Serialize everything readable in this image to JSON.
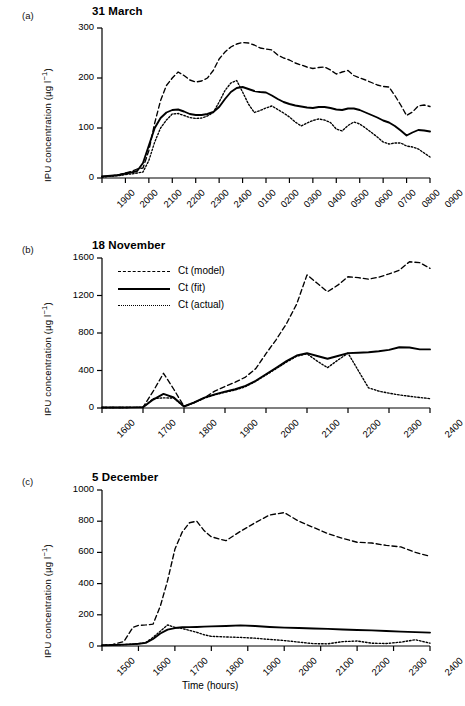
{
  "figure": {
    "series_labels": {
      "model": "Ct (model)",
      "fit": "Ct (fit)",
      "actual": "Ct (actual)"
    },
    "xaxis_title": "Time (hours)",
    "yaxis_title_parts": {
      "main": "IPU concentration (µg l",
      "exponent": "−1",
      "close": ")"
    }
  },
  "panels": [
    {
      "letter": "(a)",
      "title": "31 March",
      "ylim": [
        0,
        300
      ],
      "yticks": [
        0,
        100,
        200,
        300
      ],
      "xticks": [
        "1900",
        "2000",
        "2100",
        "2200",
        "2300",
        "2400",
        "0100",
        "0200",
        "0300",
        "0400",
        "0500",
        "0600",
        "0700",
        "0800",
        "0900"
      ]
    },
    {
      "letter": "(b)",
      "title": "18 November",
      "ylim": [
        0,
        1600
      ],
      "yticks": [
        0,
        400,
        800,
        1200,
        1600
      ],
      "xticks": [
        "1600",
        "1700",
        "1800",
        "1900",
        "2000",
        "2100",
        "2200",
        "2300",
        "2400"
      ]
    },
    {
      "letter": "(c)",
      "title": "5 December",
      "ylim": [
        0,
        1000
      ],
      "yticks": [
        0,
        200,
        400,
        600,
        800,
        1000
      ],
      "xticks": [
        "1500",
        "1600",
        "1700",
        "1800",
        "1900",
        "2000",
        "2100",
        "2200",
        "2300",
        "2400"
      ]
    }
  ],
  "chart_data": [
    {
      "type": "line",
      "panel": "(a)",
      "title": "31 March",
      "xlabel": "Time (hours)",
      "ylabel": "IPU concentration (µg l−1)",
      "ylim": [
        0,
        300
      ],
      "yticks": [
        0,
        100,
        200,
        300
      ],
      "xtick_labels": [
        "1900",
        "2000",
        "2100",
        "2200",
        "2300",
        "2400",
        "0100",
        "0200",
        "0300",
        "0400",
        "0500",
        "0600",
        "0700",
        "0800",
        "0900"
      ],
      "x_hours_from_start": [
        0,
        1,
        2,
        3,
        4,
        5,
        6,
        7,
        8,
        9,
        10,
        11,
        12,
        13,
        14
      ],
      "grid": false,
      "legend_position": "none",
      "series": [
        {
          "name": "Ct (model)",
          "style": "dashed",
          "x": [
            0,
            0.25,
            0.5,
            0.75,
            1.0,
            1.25,
            1.5,
            1.75,
            2.0,
            2.25,
            2.5,
            2.75,
            3.0,
            3.25,
            3.5,
            3.75,
            4.0,
            4.25,
            4.5,
            4.75,
            5.0,
            5.25,
            5.5,
            5.75,
            6.0,
            6.25,
            6.5,
            6.75,
            7.0,
            7.25,
            7.5,
            7.75,
            8.0,
            8.25,
            8.5,
            8.75,
            9.0,
            9.25,
            9.5,
            9.75,
            10.0,
            10.25,
            10.5,
            10.75,
            11.0,
            11.25,
            11.5,
            11.75,
            12.0,
            12.25,
            12.5,
            12.75,
            13.0,
            13.25,
            13.5,
            13.75,
            14.0
          ],
          "values": [
            3,
            4,
            5,
            7,
            10,
            13,
            18,
            20,
            55,
            110,
            155,
            185,
            200,
            212,
            205,
            196,
            192,
            194,
            200,
            215,
            238,
            252,
            262,
            268,
            271,
            270,
            266,
            260,
            258,
            256,
            246,
            240,
            236,
            230,
            226,
            222,
            219,
            221,
            222,
            216,
            208,
            212,
            215,
            205,
            200,
            196,
            191,
            186,
            183,
            182,
            165,
            146,
            125,
            132,
            144,
            146,
            143
          ]
        },
        {
          "name": "Ct (fit)",
          "style": "solid",
          "x": [
            0,
            0.25,
            0.5,
            0.75,
            1.0,
            1.25,
            1.5,
            1.75,
            2.0,
            2.25,
            2.5,
            2.75,
            3.0,
            3.25,
            3.5,
            3.75,
            4.0,
            4.25,
            4.5,
            4.75,
            5.0,
            5.25,
            5.5,
            5.75,
            6.0,
            6.25,
            6.5,
            6.75,
            7.0,
            7.25,
            7.5,
            7.75,
            8.0,
            8.25,
            8.5,
            8.75,
            9.0,
            9.25,
            9.5,
            9.75,
            10.0,
            10.25,
            10.5,
            10.75,
            11.0,
            11.25,
            11.5,
            11.75,
            12.0,
            12.25,
            12.5,
            12.75,
            13.0,
            13.25,
            13.5,
            13.75,
            14.0
          ],
          "values": [
            3,
            4,
            5,
            6,
            9,
            11,
            14,
            30,
            65,
            100,
            120,
            131,
            136,
            137,
            133,
            128,
            126,
            126,
            128,
            132,
            142,
            158,
            172,
            180,
            182,
            178,
            174,
            172,
            171,
            165,
            158,
            152,
            148,
            145,
            143,
            141,
            140,
            142,
            142,
            140,
            137,
            136,
            139,
            139,
            136,
            131,
            126,
            121,
            115,
            111,
            104,
            95,
            85,
            91,
            96,
            95,
            93
          ]
        },
        {
          "name": "Ct (actual)",
          "style": "dotted",
          "x": [
            0,
            0.25,
            0.5,
            0.75,
            1.0,
            1.25,
            1.5,
            1.75,
            2.0,
            2.25,
            2.5,
            2.75,
            3.0,
            3.25,
            3.5,
            3.75,
            4.0,
            4.25,
            4.5,
            4.75,
            5.0,
            5.25,
            5.5,
            5.75,
            6.0,
            6.25,
            6.5,
            6.75,
            7.0,
            7.25,
            7.5,
            7.75,
            8.0,
            8.25,
            8.5,
            8.75,
            9.0,
            9.25,
            9.5,
            9.75,
            10.0,
            10.25,
            10.5,
            10.75,
            11.0,
            11.25,
            11.5,
            11.75,
            12.0,
            12.25,
            12.5,
            12.75,
            13.0,
            13.25,
            13.5,
            13.75,
            14.0
          ],
          "values": [
            2,
            3,
            4,
            5,
            7,
            8,
            10,
            12,
            35,
            72,
            100,
            116,
            128,
            129,
            125,
            121,
            119,
            120,
            124,
            131,
            152,
            175,
            190,
            195,
            172,
            148,
            131,
            135,
            140,
            144,
            137,
            130,
            122,
            112,
            104,
            110,
            115,
            118,
            116,
            111,
            98,
            94,
            105,
            112,
            108,
            100,
            91,
            82,
            72,
            68,
            70,
            70,
            64,
            62,
            58,
            50,
            42
          ]
        }
      ]
    },
    {
      "type": "line",
      "panel": "(b)",
      "title": "18 November",
      "xlabel": "Time (hours)",
      "ylabel": "IPU concentration (µg l−1)",
      "ylim": [
        0,
        1600
      ],
      "yticks": [
        0,
        400,
        800,
        1200,
        1600
      ],
      "xtick_labels": [
        "1600",
        "1700",
        "1800",
        "1900",
        "2000",
        "2100",
        "2200",
        "2300",
        "2400"
      ],
      "grid": false,
      "legend_position": "upper-left-inside",
      "series": [
        {
          "name": "Ct (model)",
          "style": "dashed",
          "x": [
            0,
            0.5,
            1.0,
            1.25,
            1.5,
            1.75,
            2.0,
            2.25,
            2.5,
            2.75,
            3.0,
            3.25,
            3.5,
            3.75,
            4.0,
            4.25,
            4.5,
            4.75,
            5.0,
            5.25,
            5.5,
            5.75,
            6.0,
            6.25,
            6.5,
            6.75,
            7.0,
            7.25,
            7.5,
            7.75,
            8.0
          ],
          "values": [
            5,
            5,
            8,
            180,
            370,
            200,
            18,
            60,
            110,
            180,
            230,
            275,
            330,
            420,
            580,
            730,
            900,
            1110,
            1420,
            1330,
            1240,
            1310,
            1400,
            1390,
            1375,
            1395,
            1430,
            1470,
            1560,
            1550,
            1490
          ]
        },
        {
          "name": "Ct (fit)",
          "style": "solid",
          "x": [
            0,
            0.5,
            1.0,
            1.25,
            1.5,
            1.75,
            2.0,
            2.25,
            2.5,
            2.75,
            3.0,
            3.25,
            3.5,
            3.75,
            4.0,
            4.25,
            4.5,
            4.75,
            5.0,
            5.25,
            5.5,
            5.75,
            6.0,
            6.25,
            6.5,
            6.75,
            7.0,
            7.25,
            7.5,
            7.75,
            8.0
          ],
          "values": [
            5,
            5,
            8,
            90,
            150,
            112,
            16,
            60,
            110,
            145,
            175,
            200,
            235,
            290,
            360,
            430,
            500,
            560,
            585,
            555,
            525,
            555,
            585,
            590,
            595,
            605,
            620,
            648,
            645,
            625,
            625
          ]
        },
        {
          "name": "Ct (actual)",
          "style": "dotted",
          "x": [
            0,
            0.5,
            1.0,
            1.25,
            1.5,
            1.75,
            2.0,
            2.25,
            2.5,
            2.75,
            3.0,
            3.25,
            3.5,
            3.75,
            4.0,
            4.25,
            4.5,
            4.75,
            5.0,
            5.25,
            5.5,
            5.75,
            6.0,
            6.25,
            6.5,
            6.75,
            7.0,
            7.25,
            7.5,
            7.75,
            8.0
          ],
          "values": [
            5,
            5,
            8,
            100,
            108,
            106,
            14,
            55,
            105,
            140,
            168,
            192,
            228,
            285,
            352,
            420,
            490,
            552,
            578,
            500,
            430,
            510,
            585,
            400,
            215,
            180,
            158,
            140,
            125,
            112,
            100
          ]
        }
      ]
    },
    {
      "type": "line",
      "panel": "(c)",
      "title": "5 December",
      "xlabel": "Time (hours)",
      "ylabel": "IPU concentration (µg l−1)",
      "ylim": [
        0,
        1000
      ],
      "yticks": [
        0,
        200,
        400,
        600,
        800,
        1000
      ],
      "xtick_labels": [
        "1500",
        "1600",
        "1700",
        "1800",
        "1900",
        "2000",
        "2100",
        "2200",
        "2300",
        "2400"
      ],
      "grid": false,
      "legend_position": "none",
      "series": [
        {
          "name": "Ct (model)",
          "style": "dashed",
          "x": [
            0,
            0.3,
            0.6,
            0.85,
            1.0,
            1.2,
            1.4,
            1.6,
            1.8,
            2.0,
            2.2,
            2.4,
            2.6,
            2.8,
            3.0,
            3.4,
            3.8,
            4.2,
            4.6,
            5.0,
            5.4,
            5.8,
            6.2,
            6.6,
            7.0,
            7.4,
            7.8,
            8.2,
            8.6,
            9.0
          ],
          "values": [
            5,
            10,
            28,
            120,
            132,
            135,
            140,
            255,
            420,
            620,
            730,
            790,
            800,
            740,
            700,
            675,
            735,
            790,
            840,
            855,
            800,
            760,
            720,
            690,
            665,
            660,
            645,
            635,
            600,
            575
          ]
        },
        {
          "name": "Ct (fit)",
          "style": "solid",
          "x": [
            0,
            0.3,
            0.6,
            0.85,
            1.0,
            1.2,
            1.4,
            1.6,
            1.8,
            2.0,
            2.2,
            2.4,
            2.6,
            2.8,
            3.0,
            3.4,
            3.8,
            4.2,
            4.6,
            5.0,
            5.4,
            5.8,
            6.2,
            6.6,
            7.0,
            7.4,
            7.8,
            8.2,
            8.6,
            9.0
          ],
          "values": [
            4,
            6,
            9,
            12,
            14,
            20,
            45,
            80,
            105,
            115,
            120,
            121,
            122,
            124,
            126,
            128,
            132,
            128,
            122,
            118,
            115,
            112,
            110,
            106,
            103,
            100,
            96,
            92,
            89,
            86
          ]
        },
        {
          "name": "Ct (actual)",
          "style": "dotted",
          "x": [
            0,
            0.3,
            0.6,
            0.85,
            1.0,
            1.2,
            1.4,
            1.6,
            1.8,
            2.0,
            2.2,
            2.4,
            2.6,
            2.8,
            3.0,
            3.4,
            3.8,
            4.2,
            4.6,
            5.0,
            5.4,
            5.8,
            6.2,
            6.6,
            7.0,
            7.4,
            7.8,
            8.2,
            8.6,
            9.0
          ],
          "values": [
            4,
            6,
            9,
            12,
            14,
            22,
            55,
            95,
            135,
            120,
            112,
            100,
            88,
            72,
            62,
            58,
            55,
            50,
            42,
            35,
            25,
            15,
            14,
            28,
            32,
            18,
            16,
            25,
            40,
            18
          ]
        }
      ]
    }
  ]
}
